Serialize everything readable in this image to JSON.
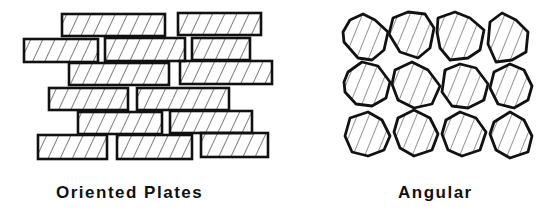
{
  "diagram": {
    "panels": [
      {
        "id": "oriented-plates",
        "label": "Oriented Plates"
      },
      {
        "id": "angular",
        "label": "Angular"
      }
    ],
    "colors": {
      "stroke": "#111111",
      "background": "#ffffff"
    }
  }
}
